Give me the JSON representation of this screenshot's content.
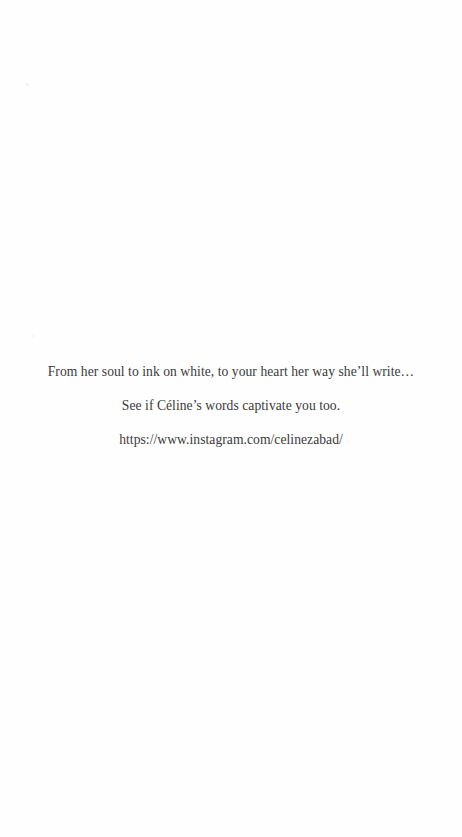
{
  "page": {
    "background": "#ffffff",
    "text_color": "#3a3a3a"
  },
  "content": {
    "tagline": "From her soul to ink on white, to your heart her way she’ll write…",
    "invitation": "See if  Céline’s words captivate you too.",
    "link": "https://www.instagram.com/celinezabad/"
  }
}
